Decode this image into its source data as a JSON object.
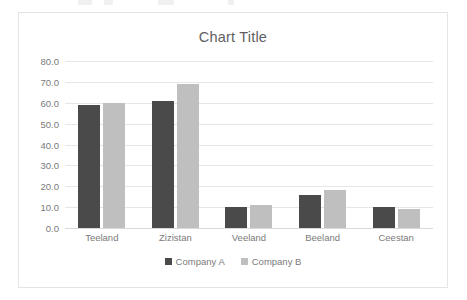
{
  "chart_data": {
    "type": "bar",
    "title": "Chart Title",
    "xlabel": "",
    "ylabel": "",
    "categories": [
      "Teeland",
      "Zizistan",
      "Veeland",
      "Beeland",
      "Ceestan"
    ],
    "series": [
      {
        "name": "Company A",
        "color": "#4a4a4a",
        "values": [
          59,
          61,
          10,
          16,
          10
        ]
      },
      {
        "name": "Company B",
        "color": "#bfbfbf",
        "values": [
          60,
          69,
          11,
          18,
          9
        ]
      }
    ],
    "ylim": [
      0,
      80
    ],
    "ytick_step": 10,
    "ytick_labels": [
      "80.0",
      "70.0",
      "60.0",
      "50.0",
      "40.0",
      "30.0",
      "20.0",
      "10.0",
      "0.0"
    ],
    "grid": "horizontal",
    "legend_position": "bottom"
  },
  "style": {
    "text_color": "#7a7a7a",
    "title_color": "#5f5f5f",
    "gridline_color": "#e6e6e6",
    "border_color": "#e4e4e4",
    "background": "#ffffff"
  }
}
